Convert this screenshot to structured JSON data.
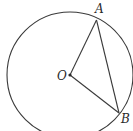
{
  "diagram": {
    "type": "circle-geometry",
    "circle": {
      "center": "O",
      "cx": 70,
      "cy": 75,
      "r": 63
    },
    "points": [
      {
        "id": "O",
        "label": "O",
        "x": 70,
        "y": 75,
        "label_x": 57,
        "label_y": 80
      },
      {
        "id": "A",
        "label": "A",
        "x": 96.5,
        "y": 20,
        "label_x": 95,
        "label_y": 13
      },
      {
        "id": "B",
        "label": "B",
        "x": 119,
        "y": 113,
        "label_x": 121,
        "label_y": 123
      }
    ],
    "segments": [
      {
        "from": "O",
        "to": "A"
      },
      {
        "from": "O",
        "to": "B"
      },
      {
        "from": "A",
        "to": "B"
      }
    ],
    "colors": {
      "stroke": "#3a3a3a",
      "label": "#2a2a2a",
      "background": "#ffffff"
    }
  }
}
